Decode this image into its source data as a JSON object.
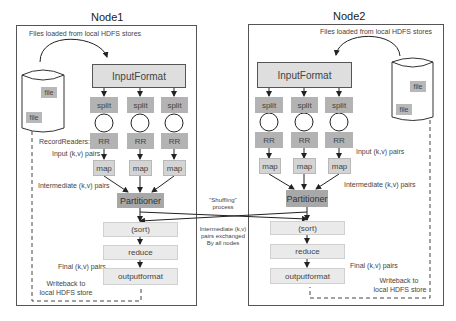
{
  "diagram": {
    "colors": {
      "frame": "#555555",
      "dark_box": "#b3b3b3",
      "light_box": "#eaeaea",
      "partitioner": "#a8a8a8",
      "input_format": "#dedede"
    },
    "shuffle": {
      "label_top": "\"Shuffling\"",
      "label_top2": "process",
      "label_bottom": "Intermediate (k,v)",
      "label_bottom2": "pairs exchanged",
      "label_bottom3": "By all nodes"
    },
    "nodes": [
      {
        "title": "Node1",
        "files_loaded": "Files loaded from local HDFS stores",
        "files": [
          "file",
          "file"
        ],
        "input_format": "InputFormat",
        "splits": [
          "split",
          "split",
          "split"
        ],
        "record_readers": [
          "RR",
          "RR",
          "RR"
        ],
        "record_readers_label": "RecordReaders:",
        "input_pairs": "Input (k,v) pairs",
        "maps": [
          "map",
          "map",
          "map"
        ],
        "intermediate_pairs": "Intermediate (k,v) pairs",
        "partitioner": "Partitioner",
        "sort": "(sort)",
        "reduce": "reduce",
        "final_pairs": "Final (k,v) pairs",
        "outputformat": "outputformat",
        "writeback_1": "Writeback to",
        "writeback_2": "local HDFS store"
      },
      {
        "title": "Node2",
        "files_loaded": "Files loaded from local HDFS stores",
        "files": [
          "file",
          "file"
        ],
        "input_format": "InputFormat",
        "splits": [
          "split",
          "split",
          "split"
        ],
        "record_readers": [
          "RR",
          "RR",
          "RR"
        ],
        "input_pairs": "Input (k,v) pairs",
        "maps": [
          "map",
          "map",
          "map"
        ],
        "intermediate_pairs": "Intermediate (k,v) pairs",
        "partitioner": "Partitioner",
        "sort": "(sort)",
        "reduce": "reduce",
        "final_pairs": "Final (k,v) pairs",
        "outputformat": "outputformat",
        "writeback_1": "Writeback to",
        "writeback_2": "local HDFS store"
      }
    ]
  }
}
